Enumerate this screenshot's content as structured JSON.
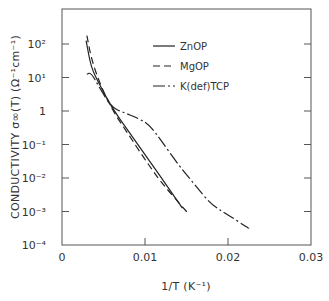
{
  "chart_data": {
    "type": "line",
    "title": "",
    "xlabel": "1/T  (K⁻¹)",
    "ylabel": "CONDUCTIVITY σ∞(T) (Ω⁻¹cm⁻¹)",
    "xlim": [
      0,
      0.03
    ],
    "ylim": [
      0.0001,
      100
    ],
    "yscale": "log",
    "x_ticks": [
      "0",
      "0.01",
      "0.02",
      "0.03"
    ],
    "y_ticks": [
      "10²",
      "10¹",
      "1",
      "10⁻¹",
      "10⁻²",
      "10⁻³",
      "10⁻⁴"
    ],
    "grid": false,
    "legend_position": "upper right",
    "series": [
      {
        "name": "ZnOP",
        "style": "solid",
        "x": [
          0.0029,
          0.0035,
          0.0045,
          0.006,
          0.008,
          0.01,
          0.012,
          0.0145
        ],
        "log10_y": [
          2.1,
          1.3,
          0.8,
          0.1,
          -0.6,
          -1.3,
          -2.0,
          -2.9
        ]
      },
      {
        "name": "MgOP",
        "style": "dashed",
        "x": [
          0.003,
          0.0035,
          0.0045,
          0.006,
          0.008,
          0.01,
          0.012,
          0.015
        ],
        "log10_y": [
          2.25,
          1.6,
          0.85,
          0.05,
          -0.7,
          -1.45,
          -2.15,
          -3.0
        ]
      },
      {
        "name": "K(def)TCP",
        "style": "dashdot",
        "x": [
          0.003,
          0.0035,
          0.0045,
          0.006,
          0.0075,
          0.009,
          0.0105,
          0.012,
          0.014,
          0.016,
          0.018,
          0.02,
          0.0225
        ],
        "log10_y": [
          1.1,
          1.15,
          0.7,
          0.1,
          -0.05,
          -0.2,
          -0.4,
          -0.9,
          -1.6,
          -2.2,
          -2.8,
          -3.1,
          -3.5
        ]
      }
    ]
  },
  "labels": {
    "xlabel": "1/T  (K⁻¹)",
    "ylabel": "CONDUCTIVITY σ∞(T) (Ω⁻¹cm⁻¹)"
  },
  "legend": [
    {
      "label": "ZnOP",
      "style": "solid"
    },
    {
      "label": "MgOP",
      "style": "dashed"
    },
    {
      "label": "K(def)TCP",
      "style": "dashdot"
    }
  ],
  "colors": {
    "line": "#222222",
    "axis": "#555555"
  }
}
